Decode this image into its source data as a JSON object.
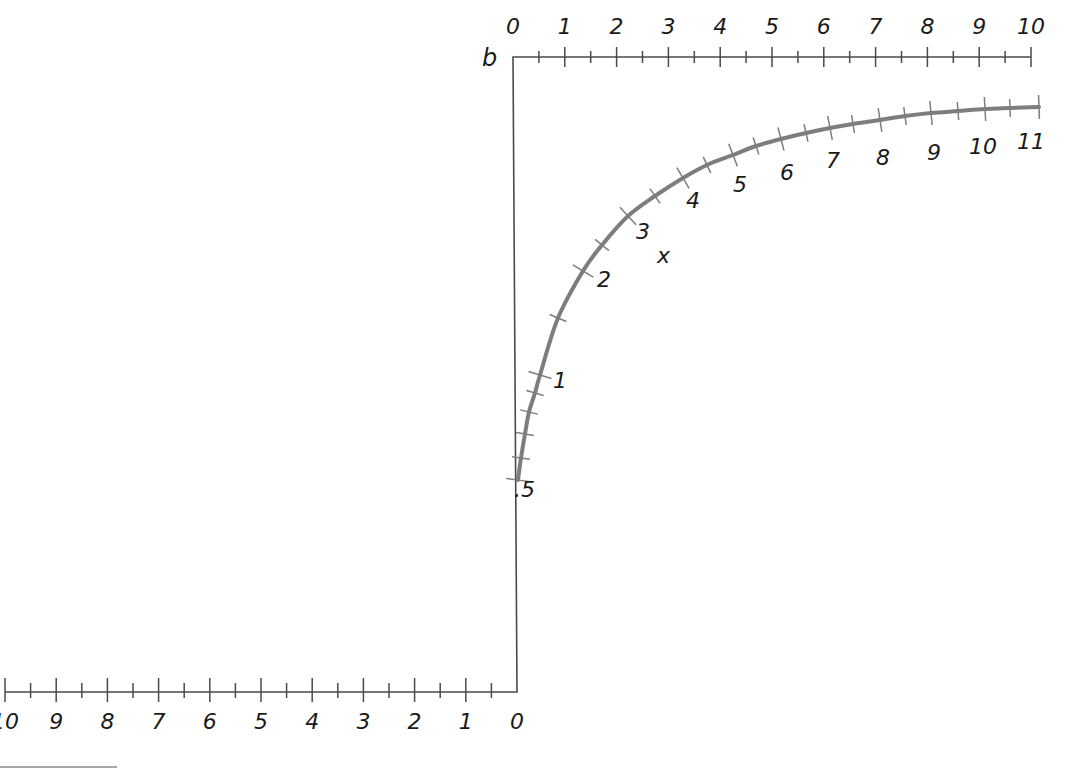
{
  "diagram": {
    "type": "nomogram",
    "colors": {
      "axis": "#4a4a4a",
      "curve": "#7d7d7d",
      "text": "#1a1a1a",
      "background": "#ffffff"
    },
    "top_scale": {
      "name": "b",
      "label": "b",
      "range": [
        0,
        10
      ],
      "major_labels": [
        "0",
        "1",
        "2",
        "3",
        "4",
        "5",
        "6",
        "7",
        "8",
        "9",
        "10"
      ],
      "minor_step": 0.5
    },
    "bottom_scale": {
      "range": [
        0,
        10
      ],
      "direction": "right-to-left",
      "major_labels": [
        "10",
        "9",
        "8",
        "7",
        "6",
        "5",
        "4",
        "3",
        "2",
        "1",
        "0"
      ],
      "minor_step": 0.5
    },
    "curve_scale": {
      "name": "x",
      "label": "x",
      "range": [
        0.5,
        11
      ],
      "major_labels": [
        ".5",
        "1",
        "2",
        "3",
        "4",
        "5",
        "6",
        "7",
        "8",
        "9",
        "10",
        "11"
      ],
      "minor_step_low": 0.1,
      "minor_step": 0.5
    }
  }
}
